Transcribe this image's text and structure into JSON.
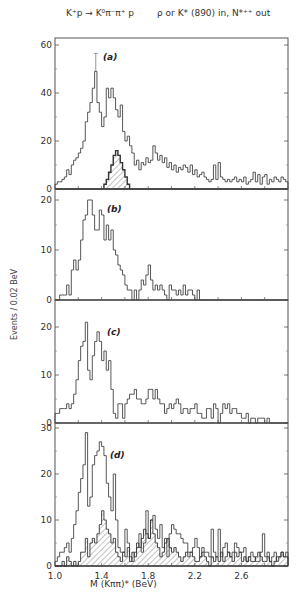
{
  "figure": {
    "title_left": "K⁺p → K⁰π⁻π⁺ p",
    "title_right": "ρ or K* (890) in, N*⁺⁺ out",
    "ylabel": "Events / 0.02 BeV",
    "xlabel": "M (Kππ)*     (BeV)"
  },
  "chart_data": {
    "type": "bar",
    "style": "step-histogram",
    "xlabel": "M (Kππ)* (BeV)",
    "ylabel": "Events / 0.02 BeV",
    "x_range": [
      1.0,
      3.0
    ],
    "bin_width": 0.02,
    "x_ticks": [
      1.0,
      1.4,
      1.8,
      2.2,
      2.6
    ],
    "x_tick_labels": [
      "1.0",
      "1.4",
      "1.8",
      "2.2",
      "2.6"
    ],
    "grid": false,
    "panels": [
      {
        "label": "(a)",
        "ylim": [
          0,
          60
        ],
        "y_ticks": [
          0,
          20,
          40,
          60
        ],
        "series": [
          {
            "name": "all events",
            "values": [
              2,
              3,
              3,
              4,
              5,
              8,
              6,
              10,
              12,
              13,
              15,
              17,
              20,
              28,
              32,
              36,
              42,
              49,
              36,
              32,
              26,
              30,
              42,
              38,
              42,
              38,
              33,
              30,
              35,
              24,
              20,
              22,
              18,
              15,
              10,
              12,
              8,
              11,
              10,
              13,
              11,
              12,
              18,
              15,
              12,
              14,
              11,
              13,
              9,
              11,
              8,
              10,
              7,
              9,
              8,
              10,
              9,
              7,
              10,
              6,
              8,
              5,
              6,
              7,
              5,
              4,
              3,
              4,
              10,
              4,
              11,
              5,
              4,
              3,
              4,
              3,
              4,
              5,
              3,
              4,
              3,
              5,
              2,
              3,
              4,
              7,
              3,
              6,
              2,
              5,
              6,
              2,
              4,
              3,
              5,
              4,
              3,
              5,
              4,
              3
            ]
          },
          {
            "name": "hatched subset",
            "hatched": true,
            "values": [
              0,
              0,
              0,
              0,
              0,
              0,
              0,
              0,
              0,
              0,
              0,
              0,
              0,
              0,
              0,
              0,
              0,
              0,
              0,
              0,
              0,
              2,
              4,
              7,
              10,
              14,
              16,
              14,
              11,
              8,
              5,
              2,
              0,
              0,
              0,
              0,
              0,
              0,
              0,
              0,
              0,
              0,
              0,
              0,
              0,
              0,
              0,
              0,
              0,
              0,
              0,
              0,
              0,
              0,
              0,
              0,
              0,
              0,
              0,
              0,
              0,
              0,
              0,
              0,
              0,
              0,
              0,
              0,
              0,
              0,
              0,
              0,
              0,
              0,
              0,
              0,
              0,
              0,
              0,
              0,
              0,
              0,
              0,
              0,
              0,
              0,
              0,
              0,
              0,
              0,
              0,
              0,
              0,
              0,
              0,
              0,
              0,
              0,
              0,
              0
            ]
          }
        ]
      },
      {
        "label": "(b)",
        "ylim": [
          0,
          20
        ],
        "y_ticks": [
          0,
          10,
          20
        ],
        "series": [
          {
            "name": "events",
            "values": [
              0,
              0,
              1,
              1,
              1,
              3,
              1,
              6,
              8,
              6,
              8,
              12,
              16,
              17,
              20,
              20,
              17,
              14,
              14,
              18,
              17,
              12,
              15,
              12,
              14,
              10,
              9,
              7,
              6,
              5,
              3,
              2,
              2,
              0,
              2,
              0,
              2,
              4,
              3,
              5,
              7,
              4,
              2,
              3,
              2,
              3,
              2,
              1,
              0,
              3,
              2,
              2,
              1,
              2,
              1,
              3,
              1,
              2,
              2,
              1,
              0,
              2,
              0,
              0,
              0,
              0,
              0,
              0,
              0,
              0,
              0,
              0,
              0,
              0,
              0,
              0,
              0,
              0,
              0,
              0,
              0,
              0,
              0,
              0,
              0,
              0,
              0,
              0,
              0,
              0,
              0,
              0,
              0,
              0,
              0,
              0,
              0,
              0,
              0,
              0
            ]
          }
        ]
      },
      {
        "label": "(c)",
        "ylim": [
          0,
          20
        ],
        "y_ticks": [
          0,
          10,
          20
        ],
        "series": [
          {
            "name": "events",
            "values": [
              2,
              2,
              3,
              3,
              3,
              4,
              3,
              4,
              6,
              9,
              13,
              16,
              17,
              23,
              11,
              9,
              14,
              17,
              19,
              17,
              13,
              15,
              11,
              13,
              7,
              2,
              1,
              4,
              4,
              1,
              4,
              5,
              6,
              6,
              7,
              5,
              5,
              4,
              4,
              5,
              7,
              7,
              5,
              7,
              5,
              4,
              4,
              2,
              3,
              4,
              3,
              4,
              5,
              4,
              2,
              3,
              3,
              2,
              3,
              3,
              4,
              2,
              2,
              1,
              1,
              3,
              3,
              1,
              4,
              3,
              0,
              2,
              4,
              3,
              4,
              2,
              3,
              3,
              2,
              2,
              1,
              1,
              2,
              0,
              1,
              1,
              0,
              1,
              1,
              1,
              0,
              1,
              0,
              0,
              0,
              0,
              0,
              0,
              0,
              0
            ]
          }
        ]
      },
      {
        "label": "(d)",
        "ylim": [
          0,
          30
        ],
        "y_ticks": [
          0,
          10,
          20,
          30
        ],
        "series": [
          {
            "name": "all events",
            "values": [
              1,
              2,
              3,
              3,
              4,
              5,
              3,
              6,
              9,
              12,
              16,
              19,
              22,
              29,
              13,
              15,
              22,
              24,
              25,
              27,
              26,
              24,
              18,
              15,
              12,
              20,
              10,
              4,
              3,
              3,
              8,
              5,
              2,
              1,
              3,
              4,
              7,
              3,
              5,
              12,
              6,
              10,
              11,
              8,
              6,
              9,
              4,
              6,
              2,
              7,
              9,
              8,
              7,
              7,
              6,
              5,
              5,
              3,
              3,
              4,
              6,
              4,
              2,
              4,
              3,
              3,
              2,
              8,
              3,
              2,
              8,
              2,
              4,
              5,
              3,
              2,
              3,
              5,
              4,
              3,
              3,
              4,
              1,
              2,
              3,
              2,
              1,
              1,
              3,
              7,
              2,
              3,
              1,
              2,
              3,
              1,
              2,
              3,
              2,
              3
            ]
          },
          {
            "name": "hatched subset",
            "hatched": true,
            "values": [
              0,
              0,
              0,
              1,
              0,
              2,
              1,
              0,
              1,
              0,
              1,
              3,
              3,
              6,
              2,
              5,
              6,
              5,
              7,
              9,
              12,
              10,
              8,
              7,
              5,
              6,
              3,
              2,
              1,
              3,
              2,
              4,
              1,
              3,
              2,
              5,
              4,
              6,
              8,
              7,
              6,
              10,
              7,
              5,
              4,
              2,
              3,
              5,
              6,
              4,
              3,
              4,
              3,
              2,
              1,
              2,
              3,
              2,
              3,
              2,
              1,
              1,
              2,
              3,
              2,
              1,
              0,
              2,
              1,
              2,
              1,
              3,
              1,
              2,
              3,
              2,
              1,
              3,
              2,
              3,
              1,
              2,
              1,
              2,
              1,
              1,
              2,
              3,
              2,
              1,
              1,
              2,
              1,
              0,
              1,
              2,
              2,
              3,
              2,
              2
            ]
          }
        ]
      }
    ]
  }
}
